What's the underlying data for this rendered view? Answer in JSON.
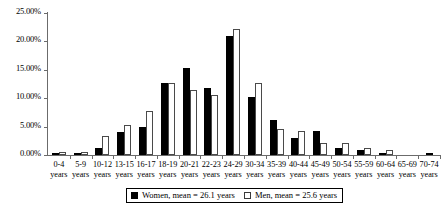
{
  "chart_data": {
    "type": "bar",
    "title": "",
    "subtitle": "",
    "xlabel": "",
    "ylabel": "",
    "ylim": [
      0,
      25
    ],
    "yticks": [
      0,
      5,
      10,
      15,
      20,
      25
    ],
    "ytick_labels": [
      "0.00%",
      "5.00%",
      "10.00%",
      "15.00%",
      "20.00%",
      "25.00%"
    ],
    "grid": false,
    "legend_position": "bottom-center",
    "value_unit": "percent",
    "categories": [
      "0-4 years",
      "5-9 years",
      "10-12 years",
      "13-15 years",
      "16-17 years",
      "18-19 years",
      "20-21 years",
      "22-23 years",
      "24-29 years",
      "30-34 years",
      "35-39 years",
      "40-44 years",
      "45-49 years",
      "50-54 years",
      "55-59 years",
      "60-64 years",
      "65-69 years",
      "70-74 years"
    ],
    "category_lines": [
      [
        "0-4",
        "years"
      ],
      [
        "5-9",
        "years"
      ],
      [
        "10-12",
        "years"
      ],
      [
        "13-15",
        "years"
      ],
      [
        "16-17",
        "years"
      ],
      [
        "18-19",
        "years"
      ],
      [
        "20-21",
        "years"
      ],
      [
        "22-23",
        "years"
      ],
      [
        "24-29",
        "years"
      ],
      [
        "30-34",
        "years"
      ],
      [
        "35-39",
        "years"
      ],
      [
        "40-44",
        "years"
      ],
      [
        "45-49",
        "years"
      ],
      [
        "50-54",
        "years"
      ],
      [
        "55-59",
        "years"
      ],
      [
        "60-64",
        "years"
      ],
      [
        "65-69",
        "years"
      ],
      [
        "70-74",
        "years"
      ]
    ],
    "series": [
      {
        "name": "Women, mean = 26.1 years",
        "key": "women",
        "color": "#000000",
        "fill": "solid-black",
        "mean": 26.1,
        "values": [
          0.3,
          0.4,
          1.3,
          4.0,
          5.0,
          12.7,
          15.4,
          11.8,
          20.9,
          10.3,
          6.2,
          3.0,
          4.2,
          1.3,
          0.9,
          0.2,
          0.0,
          0.3
        ]
      },
      {
        "name": "Men, mean = 25.6 years",
        "key": "men",
        "color": "#ffffff",
        "fill": "white-outlined",
        "mean": 25.6,
        "values": [
          0.5,
          0.6,
          3.3,
          5.2,
          7.7,
          12.7,
          11.4,
          10.6,
          22.1,
          12.6,
          4.6,
          4.3,
          2.2,
          2.2,
          1.3,
          0.8,
          0.0,
          0.0
        ]
      }
    ]
  },
  "legend": {
    "items": [
      {
        "label": "Women, mean = 26.1 years",
        "swatch": "filled-black-square"
      },
      {
        "label": "Men, mean = 25.6 years",
        "swatch": "open-white-square"
      }
    ]
  },
  "axis": {
    "y_label_suffix": "%"
  }
}
